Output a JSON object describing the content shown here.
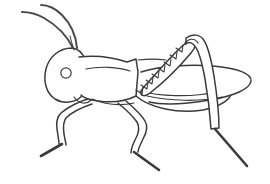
{
  "image": {
    "title": "Grasshopper line drawing",
    "subject": "grasshopper",
    "style": "black and white coloring page outline",
    "orientation": "facing left",
    "background_color": "#ffffff",
    "line_color": "#3a3a3c",
    "width": 270,
    "height": 184
  },
  "parts": {
    "antenna_upper": "antenna-upper",
    "antenna_lower": "antenna-lower",
    "head": "head",
    "eye": "eye",
    "mouth": "mouthpart",
    "pronotum": "pronotum",
    "thorax": "thorax",
    "abdomen": "abdomen",
    "wing": "wing",
    "wing_vein": "wing-vein",
    "hind_femur": "hind-femur",
    "hind_femur_markings": "hind-femur-chevrons",
    "hind_tibia": "hind-tibia",
    "hind_tarsus": "hind-tarsus",
    "front_leg": "front-leg",
    "front_tarsus": "front-tarsus",
    "middle_leg": "middle-leg",
    "middle_tarsus": "middle-tarsus"
  },
  "counts": {
    "antennae": 2,
    "legs_visible": 3,
    "femur_chevrons": 8
  }
}
